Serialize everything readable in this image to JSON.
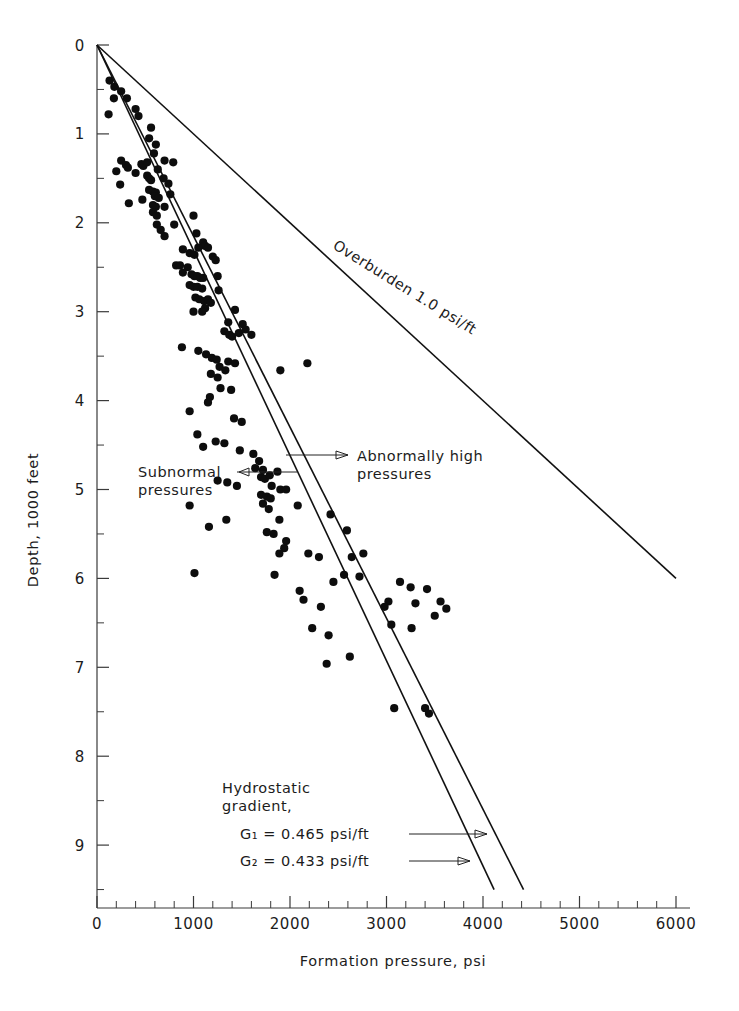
{
  "figure": {
    "background": "#ffffff",
    "ink_color": "#111111",
    "marker_color": "#0d0d0d",
    "caption": ""
  },
  "chart_data": {
    "type": "scatter",
    "title": "",
    "xlabel": "Formation pressure, psi",
    "ylabel": "Depth, 1000 feet",
    "xlim": [
      0,
      6000
    ],
    "ylim": [
      0,
      9.6
    ],
    "y_inverted": true,
    "grid": false,
    "legend_position": "none",
    "x_ticks_major": [
      0,
      1000,
      2000,
      3000,
      4000,
      5000,
      6000
    ],
    "x_tick_labels": [
      "0",
      "1000",
      "2000",
      "3000",
      "4000",
      "5000",
      "6000"
    ],
    "x_minor_step": 200,
    "y_ticks_major": [
      0,
      1,
      2,
      3,
      4,
      5,
      6,
      7,
      8,
      9
    ],
    "y_tick_labels": [
      "0",
      "1",
      "2",
      "3",
      "4",
      "5",
      "6",
      "7",
      "8",
      "9"
    ],
    "y_minor_step": 0.5,
    "x_unit": "psi",
    "y_unit": "1000 feet",
    "reference_lines": [
      {
        "name": "overburden",
        "label": "Overburden  1.0 psi/ft",
        "gradient_psi_per_ft": 1.0,
        "x": [
          0,
          6000
        ],
        "y": [
          0,
          6.0
        ],
        "style": "solid"
      },
      {
        "name": "hydrostatic-g1",
        "label": "G1 = 0.465 psi/ft",
        "gradient_psi_per_ft": 0.465,
        "x": [
          0,
          4420
        ],
        "y": [
          0,
          9.5
        ],
        "style": "solid"
      },
      {
        "name": "hydrostatic-g2",
        "label": "G2 = 0.433 psi/ft",
        "gradient_psi_per_ft": 0.433,
        "x": [
          0,
          4115
        ],
        "y": [
          0,
          9.5
        ],
        "style": "solid"
      }
    ],
    "series": [
      {
        "name": "Formation pressure measurements",
        "marker": "filled-circle",
        "color": "#0d0d0d",
        "points": [
          [
            130,
            0.4
          ],
          [
            180,
            0.47
          ],
          [
            250,
            0.52
          ],
          [
            175,
            0.6
          ],
          [
            310,
            0.6
          ],
          [
            400,
            0.72
          ],
          [
            120,
            0.78
          ],
          [
            430,
            0.8
          ],
          [
            560,
            0.93
          ],
          [
            540,
            1.05
          ],
          [
            610,
            1.12
          ],
          [
            590,
            1.22
          ],
          [
            250,
            1.3
          ],
          [
            300,
            1.35
          ],
          [
            320,
            1.38
          ],
          [
            200,
            1.42
          ],
          [
            400,
            1.44
          ],
          [
            460,
            1.34
          ],
          [
            480,
            1.36
          ],
          [
            520,
            1.32
          ],
          [
            700,
            1.3
          ],
          [
            790,
            1.32
          ],
          [
            630,
            1.4
          ],
          [
            520,
            1.47
          ],
          [
            540,
            1.5
          ],
          [
            560,
            1.52
          ],
          [
            690,
            1.5
          ],
          [
            740,
            1.56
          ],
          [
            240,
            1.57
          ],
          [
            540,
            1.63
          ],
          [
            580,
            1.65
          ],
          [
            610,
            1.66
          ],
          [
            600,
            1.7
          ],
          [
            640,
            1.72
          ],
          [
            760,
            1.68
          ],
          [
            470,
            1.74
          ],
          [
            330,
            1.78
          ],
          [
            580,
            1.8
          ],
          [
            610,
            1.82
          ],
          [
            700,
            1.82
          ],
          [
            580,
            1.88
          ],
          [
            620,
            1.92
          ],
          [
            1000,
            1.92
          ],
          [
            620,
            2.02
          ],
          [
            800,
            2.02
          ],
          [
            660,
            2.08
          ],
          [
            1030,
            2.12
          ],
          [
            700,
            2.15
          ],
          [
            1100,
            2.22
          ],
          [
            1120,
            2.26
          ],
          [
            1050,
            2.28
          ],
          [
            1150,
            2.28
          ],
          [
            890,
            2.3
          ],
          [
            960,
            2.34
          ],
          [
            1010,
            2.36
          ],
          [
            1200,
            2.38
          ],
          [
            1230,
            2.42
          ],
          [
            820,
            2.48
          ],
          [
            860,
            2.48
          ],
          [
            940,
            2.5
          ],
          [
            890,
            2.56
          ],
          [
            980,
            2.58
          ],
          [
            1010,
            2.6
          ],
          [
            1040,
            2.6
          ],
          [
            1070,
            2.62
          ],
          [
            1100,
            2.62
          ],
          [
            1250,
            2.6
          ],
          [
            960,
            2.7
          ],
          [
            1000,
            2.72
          ],
          [
            1040,
            2.72
          ],
          [
            1090,
            2.74
          ],
          [
            1260,
            2.76
          ],
          [
            1020,
            2.84
          ],
          [
            1060,
            2.86
          ],
          [
            1110,
            2.88
          ],
          [
            1150,
            2.86
          ],
          [
            1180,
            2.9
          ],
          [
            1120,
            2.96
          ],
          [
            1000,
            3.0
          ],
          [
            1090,
            3.0
          ],
          [
            1430,
            2.98
          ],
          [
            1360,
            3.12
          ],
          [
            1510,
            3.14
          ],
          [
            1320,
            3.22
          ],
          [
            1370,
            3.26
          ],
          [
            1400,
            3.28
          ],
          [
            1470,
            3.24
          ],
          [
            1540,
            3.2
          ],
          [
            1600,
            3.26
          ],
          [
            880,
            3.4
          ],
          [
            1050,
            3.44
          ],
          [
            1130,
            3.48
          ],
          [
            1190,
            3.52
          ],
          [
            1240,
            3.54
          ],
          [
            1360,
            3.56
          ],
          [
            1430,
            3.58
          ],
          [
            1270,
            3.62
          ],
          [
            1330,
            3.66
          ],
          [
            1180,
            3.7
          ],
          [
            1250,
            3.74
          ],
          [
            2180,
            3.58
          ],
          [
            1900,
            3.66
          ],
          [
            1280,
            3.86
          ],
          [
            1390,
            3.88
          ],
          [
            1170,
            3.96
          ],
          [
            1150,
            4.02
          ],
          [
            960,
            4.12
          ],
          [
            1420,
            4.2
          ],
          [
            1500,
            4.24
          ],
          [
            1040,
            4.38
          ],
          [
            1230,
            4.46
          ],
          [
            1320,
            4.48
          ],
          [
            1100,
            4.52
          ],
          [
            1480,
            4.56
          ],
          [
            1620,
            4.6
          ],
          [
            1680,
            4.68
          ],
          [
            1640,
            4.76
          ],
          [
            1720,
            4.78
          ],
          [
            1700,
            4.86
          ],
          [
            1740,
            4.88
          ],
          [
            1790,
            4.84
          ],
          [
            1870,
            4.8
          ],
          [
            1250,
            4.9
          ],
          [
            1350,
            4.92
          ],
          [
            1450,
            4.96
          ],
          [
            1810,
            4.96
          ],
          [
            1900,
            5.0
          ],
          [
            1960,
            5.0
          ],
          [
            1700,
            5.06
          ],
          [
            1760,
            5.08
          ],
          [
            1800,
            5.1
          ],
          [
            1720,
            5.16
          ],
          [
            960,
            5.18
          ],
          [
            1780,
            5.22
          ],
          [
            2080,
            5.18
          ],
          [
            1340,
            5.34
          ],
          [
            1890,
            5.34
          ],
          [
            2420,
            5.28
          ],
          [
            1160,
            5.42
          ],
          [
            1760,
            5.48
          ],
          [
            1830,
            5.5
          ],
          [
            2590,
            5.46
          ],
          [
            1960,
            5.58
          ],
          [
            1940,
            5.66
          ],
          [
            1890,
            5.72
          ],
          [
            2190,
            5.72
          ],
          [
            2300,
            5.76
          ],
          [
            2640,
            5.76
          ],
          [
            2760,
            5.72
          ],
          [
            1010,
            5.94
          ],
          [
            1840,
            5.96
          ],
          [
            2560,
            5.96
          ],
          [
            2720,
            5.98
          ],
          [
            2450,
            6.04
          ],
          [
            2100,
            6.14
          ],
          [
            2140,
            6.24
          ],
          [
            2320,
            6.32
          ],
          [
            3140,
            6.04
          ],
          [
            3250,
            6.1
          ],
          [
            3420,
            6.12
          ],
          [
            3020,
            6.26
          ],
          [
            2980,
            6.32
          ],
          [
            3300,
            6.28
          ],
          [
            3560,
            6.26
          ],
          [
            3620,
            6.34
          ],
          [
            3500,
            6.42
          ],
          [
            2230,
            6.56
          ],
          [
            2400,
            6.64
          ],
          [
            3050,
            6.52
          ],
          [
            3260,
            6.56
          ],
          [
            2620,
            6.88
          ],
          [
            2380,
            6.96
          ],
          [
            3080,
            7.46
          ],
          [
            3400,
            7.46
          ],
          [
            3440,
            7.52
          ]
        ]
      }
    ],
    "annotations": [
      {
        "name": "subnormal-pressures",
        "text_lines": [
          "Subnormal",
          "pressures"
        ],
        "arrow_direction": "right",
        "anchor_x": 1770,
        "anchor_y": 4.78
      },
      {
        "name": "abnormally-high-pressures",
        "text_lines": [
          "Abnormally  high",
          "pressures"
        ],
        "arrow_direction": "left",
        "anchor_x": 1890,
        "anchor_y": 4.5
      },
      {
        "name": "hydrostatic-gradient-block",
        "text_lines": [
          "Hydrostatic",
          "gradient,",
          "G₁  =  0.465  psi/ft",
          "G₂  =  0.433  psi/ft"
        ]
      },
      {
        "name": "overburden-label",
        "text_lines": [
          "Overburden  1.0 psi/ft"
        ],
        "rotation_deg": 32
      }
    ]
  }
}
